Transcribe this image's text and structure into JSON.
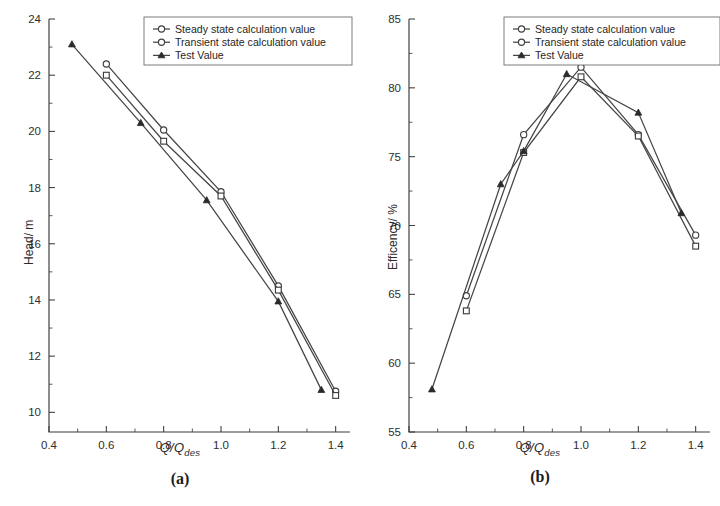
{
  "figure": {
    "panels": [
      {
        "caption": "(a)",
        "x_title_main": "Q/Q",
        "x_title_sub": "des",
        "y_title": "Head/ m"
      },
      {
        "caption": "(b)",
        "x_title_main": "Q/Q",
        "x_title_sub": "des",
        "y_title": "Efficency/ %"
      }
    ]
  },
  "legend": {
    "items": [
      {
        "label": "Steady state calculation value",
        "marker": "open-circle"
      },
      {
        "label": "Transient state calculation value",
        "marker": "open-circle"
      },
      {
        "label": "Test Value",
        "marker": "solid-triangle"
      }
    ]
  },
  "chart_data": [
    {
      "type": "line",
      "title": "(a)",
      "xlabel": "Q/Qdes",
      "ylabel": "Head/ m",
      "xlim": [
        0.4,
        1.45
      ],
      "ylim": [
        9.3,
        24
      ],
      "xticks": [
        0.4,
        0.6,
        0.8,
        1.0,
        1.2,
        1.4
      ],
      "xticklabels": [
        "0.4",
        "0.6",
        "0.8",
        "1.0",
        "1.2",
        "1.4"
      ],
      "yticks": [
        10,
        12,
        14,
        16,
        18,
        20,
        22,
        24
      ],
      "yticklabels": [
        "10",
        "12",
        "14",
        "16",
        "18",
        "20",
        "22",
        "24"
      ],
      "minor_ticks": true,
      "grid": false,
      "legend_position": "top-right",
      "series": [
        {
          "name": "Steady state calculation value",
          "marker": "open-circle",
          "x": [
            0.6,
            0.8,
            1.0,
            1.2,
            1.4
          ],
          "values": [
            22.4,
            20.05,
            17.85,
            14.5,
            10.75
          ]
        },
        {
          "name": "Transient state calculation value",
          "marker": "open-square",
          "x": [
            0.6,
            0.8,
            1.0,
            1.2,
            1.4
          ],
          "values": [
            22.0,
            19.65,
            17.7,
            14.35,
            10.6
          ]
        },
        {
          "name": "Test Value",
          "marker": "solid-triangle",
          "x": [
            0.48,
            0.72,
            0.95,
            1.2,
            1.35
          ],
          "values": [
            23.1,
            20.3,
            17.55,
            13.95,
            10.8
          ]
        }
      ]
    },
    {
      "type": "line",
      "title": "(b)",
      "xlabel": "Q/Qdes",
      "ylabel": "Efficency/ %",
      "xlim": [
        0.4,
        1.45
      ],
      "ylim": [
        55,
        85
      ],
      "xticks": [
        0.4,
        0.6,
        0.8,
        1.0,
        1.2,
        1.4
      ],
      "xticklabels": [
        "0.4",
        "0.6",
        "0.8",
        "1.0",
        "1.2",
        "1.4"
      ],
      "yticks": [
        55,
        60,
        65,
        70,
        75,
        80,
        85
      ],
      "yticklabels": [
        "55",
        "60",
        "65",
        "70",
        "75",
        "80",
        "85"
      ],
      "minor_ticks": true,
      "grid": false,
      "legend_position": "top-right",
      "series": [
        {
          "name": "Steady state calculation value",
          "marker": "open-circle",
          "x": [
            0.6,
            0.8,
            1.0,
            1.2,
            1.4
          ],
          "values": [
            64.9,
            76.6,
            81.5,
            76.6,
            69.3
          ]
        },
        {
          "name": "Transient state calculation value",
          "marker": "open-square",
          "x": [
            0.6,
            0.8,
            1.0,
            1.2,
            1.4
          ],
          "values": [
            63.8,
            75.3,
            80.8,
            76.5,
            68.5
          ]
        },
        {
          "name": "Test Value",
          "marker": "solid-triangle",
          "x": [
            0.48,
            0.72,
            0.8,
            0.95,
            1.2,
            1.35
          ],
          "values": [
            58.1,
            73.0,
            75.4,
            81.0,
            78.2,
            70.9
          ]
        }
      ]
    }
  ]
}
